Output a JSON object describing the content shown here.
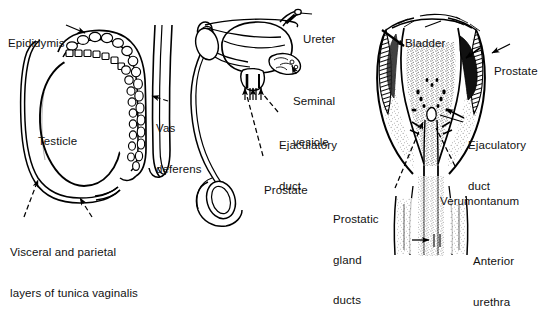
{
  "figure": {
    "background_color": "#ffffff",
    "ink_color": "#000000",
    "panels": [
      {
        "id": "panel-testicle",
        "name": "testicle-and-epididymis",
        "labels": [
          {
            "id": "epididymis",
            "text": "Epididymis"
          },
          {
            "id": "testicle",
            "text": "Testicle"
          },
          {
            "id": "vas-deferens",
            "lines": [
              "Vas",
              "deferens"
            ]
          },
          {
            "id": "tunica-vaginalis",
            "lines": [
              "Visceral and parietal",
              "layers of tunica vaginalis"
            ]
          }
        ]
      },
      {
        "id": "panel-bladder-overview",
        "name": "bladder-seminal-vesicle-prostate",
        "labels": [
          {
            "id": "ureter",
            "text": "Ureter"
          },
          {
            "id": "seminal-vesicle",
            "lines": [
              "Seminal",
              "vesicle"
            ]
          },
          {
            "id": "ejaculatory-duct-mid",
            "lines": [
              "Ejaculatory",
              "duct"
            ]
          },
          {
            "id": "prostate-mid",
            "text": "Prostate"
          }
        ]
      },
      {
        "id": "panel-prostate-section",
        "name": "prostate-coronal-section",
        "labels": [
          {
            "id": "bladder",
            "text": "Bladder"
          },
          {
            "id": "prostate-right",
            "text": "Prostate"
          },
          {
            "id": "ejaculatory-duct-right",
            "lines": [
              "Ejaculatory",
              "duct"
            ]
          },
          {
            "id": "verumontanum",
            "text": "Verumontanum"
          },
          {
            "id": "prostatic-gland-ducts",
            "lines": [
              "Prostatic",
              "gland",
              "ducts"
            ]
          },
          {
            "id": "anterior-urethra",
            "lines": [
              "Anterior",
              "urethra"
            ]
          }
        ]
      }
    ]
  },
  "labels": {
    "epididymis": "Epididymis",
    "testicle": "Testicle",
    "vas_deferens_1": "Vas",
    "vas_deferens_2": "deferens",
    "tunica_1": "Visceral and parietal",
    "tunica_2": "layers of tunica vaginalis",
    "ureter": "Ureter",
    "seminal_vesicle_1": "Seminal",
    "seminal_vesicle_2": "vesicle",
    "ejaculatory_duct_mid_1": "Ejaculatory",
    "ejaculatory_duct_mid_2": "duct",
    "prostate_mid": "Prostate",
    "bladder": "Bladder",
    "prostate_right": "Prostate",
    "ejaculatory_duct_right_1": "Ejaculatory",
    "ejaculatory_duct_right_2": "duct",
    "verumontanum": "Verumontanum",
    "prostatic_gland_ducts_1": "Prostatic",
    "prostatic_gland_ducts_2": "gland",
    "prostatic_gland_ducts_3": "ducts",
    "anterior_urethra_1": "Anterior",
    "anterior_urethra_2": "urethra"
  }
}
